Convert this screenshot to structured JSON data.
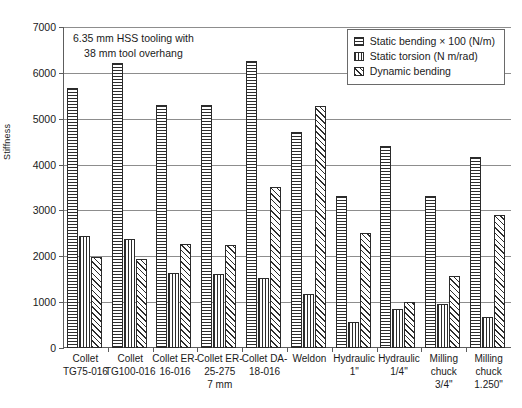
{
  "chart_data": {
    "type": "bar",
    "title": "",
    "annotation": [
      "6.35 mm HSS tooling with",
      "38 mm tool overhang"
    ],
    "xlabel": "",
    "ylabel": "Stiffness",
    "ylim": [
      0,
      7000
    ],
    "yticks": [
      0,
      1000,
      2000,
      3000,
      4000,
      5000,
      6000,
      7000
    ],
    "ytick_labels": [
      "0",
      "1000",
      "2000",
      "3000",
      "4000",
      "5000",
      "6000",
      "7000"
    ],
    "grid": "horizontal",
    "legend_position": "top-right",
    "categories": [
      [
        "Collet",
        "TG75-016"
      ],
      [
        "Collet",
        "TG100-016"
      ],
      [
        "Collet ER-",
        "16-016"
      ],
      [
        "Collet ER-",
        "25-275",
        "7 mm"
      ],
      [
        "Collet DA-",
        "18-016"
      ],
      [
        "Weldon"
      ],
      [
        "Hydraulic",
        "1\""
      ],
      [
        "Hydraulic",
        "1/4\""
      ],
      [
        "Milling",
        "chuck",
        "3/4\""
      ],
      [
        "Milling",
        "chuck",
        "1.250\""
      ]
    ],
    "series": [
      {
        "name": "Static bending × 100 (N/m)",
        "pattern": "horizontal-lines",
        "values": [
          5680,
          6220,
          5310,
          5310,
          6250,
          4720,
          3320,
          4400,
          3310,
          4170
        ]
      },
      {
        "name": "Static torsion (N m/rad)",
        "pattern": "vertical-lines",
        "values": [
          2450,
          2380,
          1630,
          1610,
          1530,
          1170,
          560,
          840,
          960,
          670
        ]
      },
      {
        "name": "Dynamic bending",
        "pattern": "diagonal-hatch",
        "values": [
          1980,
          1950,
          2260,
          2250,
          3510,
          5270,
          2500,
          1010,
          1570,
          2900
        ]
      }
    ]
  },
  "colors": {
    "axis": "#5d5d5d",
    "grid": "#8d8d8d",
    "bar_outline": "#2b2b2b",
    "text": "#1a1a1a",
    "background": "#ffffff"
  }
}
